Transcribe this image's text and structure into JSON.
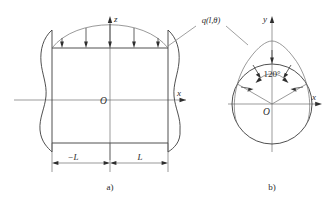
{
  "figure": {
    "background_color": "#ffffff",
    "line_color": "#3c3c3c",
    "axis_color": "#707070",
    "width": 335,
    "height": 205
  },
  "panel_a": {
    "caption": "a)",
    "axis_vertical_label": "z",
    "axis_horizontal_label": "x",
    "origin_label": "O",
    "dimension_left_label": "−L",
    "dimension_right_label": "L",
    "load_arrow_count": 5,
    "description": "longitudinal-section-view"
  },
  "panel_b": {
    "caption": "b)",
    "axis_vertical_label": "y",
    "axis_horizontal_label": "x",
    "origin_label": "O",
    "angle_label": "120°",
    "angle_value_degrees": 120,
    "load_arrow_count": 5,
    "description": "cross-section-view"
  },
  "annotations": {
    "load_function_label": "q(l,θ)"
  }
}
